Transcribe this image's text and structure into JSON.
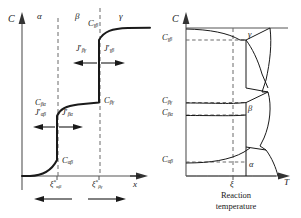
{
  "figure": {
    "type": "diagram"
  },
  "left_panel": {
    "axis_y_label": "C",
    "axis_x_label": "x",
    "phase_labels": [
      "α",
      "β",
      "γ"
    ],
    "concentration_labels": [
      {
        "base": "C",
        "sub": "γβ"
      },
      {
        "base": "C",
        "sub": "βγ"
      },
      {
        "base": "C",
        "sub": "βα"
      },
      {
        "base": "C",
        "sub": "αβ"
      }
    ],
    "flux_labels": [
      {
        "base": "J",
        "prime": "′",
        "sub": "βγ"
      },
      {
        "base": "J",
        "prime": "′",
        "sub": "γβ"
      },
      {
        "base": "J",
        "prime": "′",
        "sub": "αβ"
      },
      {
        "base": "J",
        "prime": "′",
        "sub": "βα"
      }
    ],
    "interface_tick_labels": [
      {
        "base": "ξ",
        "star": "*",
        "sub": "αβ"
      },
      {
        "base": "ξ",
        "star": "*",
        "sub": "βγ"
      }
    ]
  },
  "right_panel": {
    "axis_y_label": "C",
    "axis_x_label": "T",
    "tick_label_x": "ξ",
    "phase_labels": [
      "γ",
      "β",
      "α"
    ],
    "concentration_labels": [
      {
        "base": "C",
        "sub": "γβ"
      },
      {
        "base": "C",
        "sub": "βγ"
      },
      {
        "base": "C",
        "sub": "βα"
      },
      {
        "base": "C",
        "sub": "αβ"
      }
    ],
    "caption_line1": "Reaction",
    "caption_line2": "temperature"
  },
  "colors": {
    "curve": "#1a1a1a",
    "axis": "#555555",
    "dashed": "#6b6b6b",
    "text": "#1a1a1a"
  }
}
